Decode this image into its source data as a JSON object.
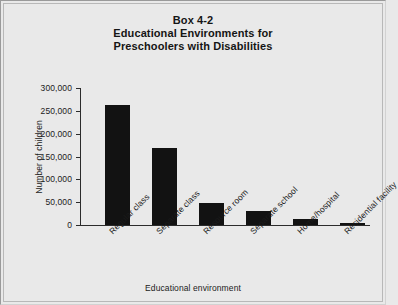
{
  "figure": {
    "title_lines": [
      "Box 4-2",
      "Educational Environments for",
      "Preschoolers with Disabilities"
    ],
    "background_color": "#e9e9e9",
    "bar_color": "#121212",
    "axis_color": "#2b2b2b"
  },
  "chart_data": {
    "type": "bar",
    "title": "Box 4-2 Educational Environments for Preschoolers with Disabilities",
    "xlabel": "Educational environment",
    "ylabel": "Number of children",
    "categories": [
      "Regular class",
      "Separate class",
      "Resource room",
      "Separate school",
      "Home/hospital",
      "Residential facility"
    ],
    "values": [
      262000,
      168000,
      48000,
      30000,
      13000,
      5000
    ],
    "ylim": [
      0,
      300000
    ],
    "yticks": [
      0,
      50000,
      100000,
      150000,
      200000,
      250000,
      300000
    ],
    "ytick_labels": [
      "0",
      "50,000",
      "100,000",
      "150,000",
      "200,000",
      "250,000",
      "300,000"
    ],
    "grid": false,
    "legend": false
  }
}
